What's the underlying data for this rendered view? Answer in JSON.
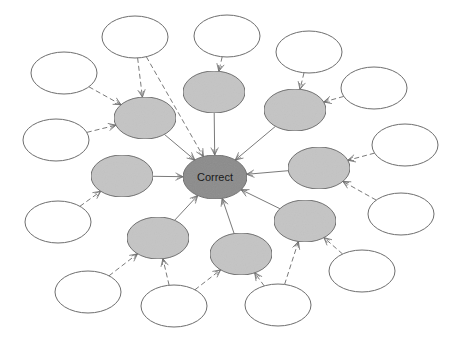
{
  "diagram": {
    "type": "concept-map",
    "colors": {
      "background": "#ffffff",
      "center_fill": "#8c8c8c",
      "mid_fill": "#c4c4c4",
      "outer_fill": "#ffffff",
      "stroke": "#6e6e6e",
      "edge": "#7a7a7a"
    },
    "center": {
      "id": "center",
      "label": "Correct",
      "cx": 215,
      "cy": 177,
      "rx": 32,
      "ry": 22
    },
    "mid_nodes": [
      {
        "id": "m1",
        "label": "",
        "cx": 145,
        "cy": 118,
        "rx": 31,
        "ry": 21
      },
      {
        "id": "m2",
        "label": "",
        "cx": 214,
        "cy": 92,
        "rx": 31,
        "ry": 21
      },
      {
        "id": "m3",
        "label": "",
        "cx": 295,
        "cy": 110,
        "rx": 31,
        "ry": 21
      },
      {
        "id": "m4",
        "label": "",
        "cx": 122,
        "cy": 176,
        "rx": 31,
        "ry": 21
      },
      {
        "id": "m5",
        "label": "",
        "cx": 319,
        "cy": 168,
        "rx": 31,
        "ry": 21
      },
      {
        "id": "m6",
        "label": "",
        "cx": 305,
        "cy": 221,
        "rx": 31,
        "ry": 21
      },
      {
        "id": "m7",
        "label": "",
        "cx": 158,
        "cy": 238,
        "rx": 31,
        "ry": 21
      },
      {
        "id": "m8",
        "label": "",
        "cx": 241,
        "cy": 254,
        "rx": 31,
        "ry": 21
      }
    ],
    "outer_nodes": [
      {
        "id": "o1",
        "label": "",
        "cx": 135,
        "cy": 37,
        "rx": 33,
        "ry": 21
      },
      {
        "id": "o2",
        "label": "",
        "cx": 227,
        "cy": 36,
        "rx": 33,
        "ry": 21
      },
      {
        "id": "o3",
        "label": "",
        "cx": 309,
        "cy": 52,
        "rx": 33,
        "ry": 21
      },
      {
        "id": "o4",
        "label": "",
        "cx": 374,
        "cy": 88,
        "rx": 33,
        "ry": 21
      },
      {
        "id": "o5",
        "label": "",
        "cx": 64,
        "cy": 73,
        "rx": 33,
        "ry": 21
      },
      {
        "id": "o6",
        "label": "",
        "cx": 56,
        "cy": 140,
        "rx": 33,
        "ry": 21
      },
      {
        "id": "o7",
        "label": "",
        "cx": 405,
        "cy": 145,
        "rx": 33,
        "ry": 21
      },
      {
        "id": "o8",
        "label": "",
        "cx": 401,
        "cy": 214,
        "rx": 33,
        "ry": 21
      },
      {
        "id": "o9",
        "label": "",
        "cx": 58,
        "cy": 222,
        "rx": 33,
        "ry": 21
      },
      {
        "id": "o10",
        "label": "",
        "cx": 362,
        "cy": 271,
        "rx": 33,
        "ry": 21
      },
      {
        "id": "o11",
        "label": "",
        "cx": 88,
        "cy": 292,
        "rx": 33,
        "ry": 21
      },
      {
        "id": "o12",
        "label": "",
        "cx": 174,
        "cy": 306,
        "rx": 33,
        "ry": 21
      },
      {
        "id": "o13",
        "label": "",
        "cx": 278,
        "cy": 305,
        "rx": 33,
        "ry": 21
      }
    ],
    "edges": [
      {
        "from": "m1",
        "to": "center",
        "style": "solid"
      },
      {
        "from": "m2",
        "to": "center",
        "style": "solid"
      },
      {
        "from": "m3",
        "to": "center",
        "style": "solid"
      },
      {
        "from": "m4",
        "to": "center",
        "style": "solid"
      },
      {
        "from": "m5",
        "to": "center",
        "style": "solid"
      },
      {
        "from": "m6",
        "to": "center",
        "style": "solid"
      },
      {
        "from": "m7",
        "to": "center",
        "style": "solid"
      },
      {
        "from": "m8",
        "to": "center",
        "style": "solid"
      },
      {
        "from": "o1",
        "to": "m1",
        "style": "dashed"
      },
      {
        "from": "o1",
        "to": "center",
        "style": "dashed"
      },
      {
        "from": "o2",
        "to": "m2",
        "style": "dashed"
      },
      {
        "from": "o3",
        "to": "m3",
        "style": "dashed"
      },
      {
        "from": "o4",
        "to": "m3",
        "style": "dashed"
      },
      {
        "from": "o5",
        "to": "m1",
        "style": "dashed"
      },
      {
        "from": "o6",
        "to": "m1",
        "style": "dashed"
      },
      {
        "from": "o7",
        "to": "m5",
        "style": "dashed"
      },
      {
        "from": "o8",
        "to": "m5",
        "style": "dashed"
      },
      {
        "from": "o9",
        "to": "m4",
        "style": "dashed"
      },
      {
        "from": "o10",
        "to": "m6",
        "style": "dashed"
      },
      {
        "from": "o11",
        "to": "m7",
        "style": "dashed"
      },
      {
        "from": "o12",
        "to": "m7",
        "style": "dashed"
      },
      {
        "from": "o12",
        "to": "m8",
        "style": "dashed"
      },
      {
        "from": "o13",
        "to": "m8",
        "style": "dashed"
      },
      {
        "from": "o13",
        "to": "m6",
        "style": "dashed"
      }
    ]
  }
}
